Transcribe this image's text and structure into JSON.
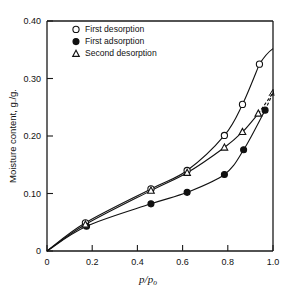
{
  "chart_data": {
    "type": "line",
    "title": "",
    "xlabel": "p/p₀",
    "xlabel_parts": {
      "num": "p",
      "den": "p",
      "den_sub": "o"
    },
    "ylabel": "Moisture content, g./g.",
    "xlim": [
      0,
      1.0
    ],
    "ylim": [
      0,
      0.4
    ],
    "xticks": [
      0,
      0.2,
      0.4,
      0.6,
      0.8,
      1.0
    ],
    "xticklabels": [
      "0",
      "0.2",
      "0.4",
      "0.6",
      "0.8",
      "1.0"
    ],
    "yticks": [
      0,
      0.1,
      0.2,
      0.3,
      0.4
    ],
    "yticklabels": [
      "0",
      "0.10",
      "0.20",
      "0.30",
      "0.40"
    ],
    "grid": false,
    "legend_position": "top-left-inside",
    "series": [
      {
        "name": "First desorption",
        "marker": "open-circle",
        "linestyle": "solid",
        "x": [
          0.0,
          0.17,
          0.46,
          0.62,
          0.785,
          0.865,
          0.94
        ],
        "y": [
          0.0,
          0.049,
          0.108,
          0.14,
          0.201,
          0.255,
          0.325
        ]
      },
      {
        "name": "First adsorption",
        "marker": "filled-circle",
        "linestyle": "solid",
        "x": [
          0.0,
          0.175,
          0.46,
          0.62,
          0.785,
          0.87,
          0.965
        ],
        "y": [
          0.0,
          0.043,
          0.082,
          0.102,
          0.133,
          0.176,
          0.245
        ]
      },
      {
        "name": "Second desorption",
        "marker": "open-triangle",
        "linestyle": "solid",
        "x": [
          0.0,
          0.17,
          0.46,
          0.62,
          0.785,
          0.865,
          0.935
        ],
        "y": [
          0.0,
          0.046,
          0.105,
          0.136,
          0.18,
          0.207,
          0.239
        ]
      }
    ],
    "annotations": [
      {
        "type": "dashed-converge",
        "note": "dashed segments join curves near p/p0 = 1.0 at ~0.275"
      }
    ],
    "convergence_point": {
      "x": 1.0,
      "y": 0.275
    },
    "legend": [
      {
        "label": "First desorption",
        "marker": "open-circle"
      },
      {
        "label": "First adsorption",
        "marker": "filled-circle"
      },
      {
        "label": "Second desorption",
        "marker": "open-triangle"
      }
    ],
    "colors": {
      "ink": "#111111",
      "background": "#ffffff"
    }
  }
}
